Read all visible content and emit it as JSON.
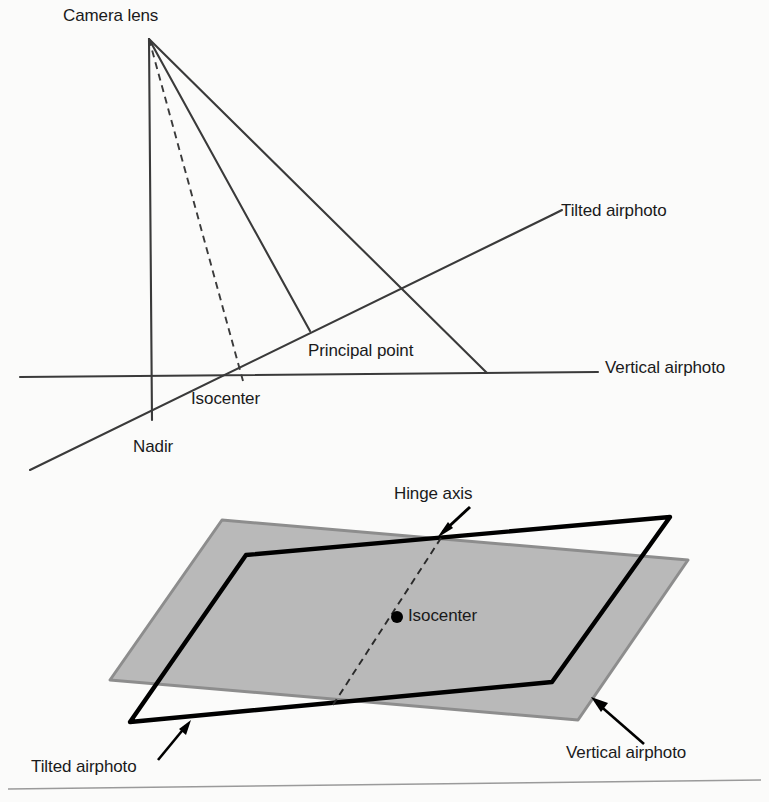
{
  "figure": {
    "background_color": "#fbfbfa"
  },
  "colors": {
    "line": "#3a3a3a",
    "line_dark": "#000000",
    "gray_fill": "#b9b9b9",
    "gray_edge": "#8d8d8d",
    "text": "#1a1a1a",
    "rule": "#9a9a9a"
  },
  "upper_diagram": {
    "name": "tilt-geometry-side-view",
    "labels": {
      "camera_lens": "Camera lens",
      "principal_point": "Principal point",
      "isocenter": "Isocenter",
      "nadir": "Nadir",
      "tilted_airphoto": "Tilted airphoto",
      "vertical_airphoto": "Vertical airphoto"
    },
    "points": {
      "camera_lens": [
        149,
        39
      ],
      "nadir": [
        152,
        420
      ],
      "isocenter": [
        240,
        375
      ],
      "principal_point": [
        310,
        330
      ],
      "ray_right_end": [
        487,
        373
      ]
    },
    "lines": {
      "vertical_airphoto": [
        [
          20,
          377
        ],
        [
          598,
          372
        ]
      ],
      "tilted_airphoto": [
        [
          30,
          470
        ],
        [
          552,
          215
        ]
      ],
      "nadir_ray": [
        [
          149,
          39
        ],
        [
          152,
          420
        ]
      ],
      "isocenter_ray_dashed": [
        [
          149,
          39
        ],
        [
          243,
          380
        ]
      ],
      "principal_ray": [
        [
          149,
          39
        ],
        [
          310,
          330
        ]
      ],
      "outer_ray": [
        [
          149,
          39
        ],
        [
          487,
          373
        ]
      ]
    }
  },
  "lower_diagram": {
    "name": "tilt-geometry-plan-view",
    "labels": {
      "hinge_axis": "Hinge axis",
      "isocenter": "Isocenter",
      "tilted_airphoto": "Tilted airphoto",
      "vertical_airphoto": "Vertical airphoto"
    },
    "vertical_airphoto_polygon": [
      [
        222,
        520
      ],
      [
        688,
        560
      ],
      [
        578,
        720
      ],
      [
        110,
        680
      ]
    ],
    "tilted_airphoto_polygon": [
      [
        246,
        555
      ],
      [
        670,
        517
      ],
      [
        552,
        682
      ],
      [
        130,
        722
      ]
    ],
    "hinge_axis_dashed": [
      [
        440,
        540
      ],
      [
        330,
        706
      ]
    ],
    "isocenter_point": [
      397,
      617
    ],
    "arrows": {
      "hinge_axis": {
        "from": [
          470,
          508
        ],
        "to": [
          438,
          537
        ]
      },
      "tilted_airphoto": {
        "from": [
          160,
          758
        ],
        "to": [
          188,
          722
        ]
      },
      "vertical_airphoto": {
        "from": [
          640,
          740
        ],
        "to": [
          591,
          697
        ]
      }
    }
  },
  "footer_rule": {
    "name": "page-rule",
    "from": [
      8,
      789
    ],
    "to": [
      761,
      780
    ]
  }
}
